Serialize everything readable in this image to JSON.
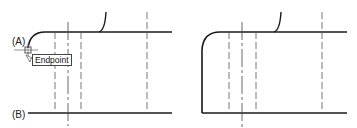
{
  "labels": {
    "a": "(A)",
    "b": "(B)"
  },
  "tooltip": {
    "text": "Endpoint"
  },
  "colors": {
    "stroke": "#1a1a1a",
    "dashed": "#555555",
    "snap_marker": "#666666"
  },
  "panels": [
    {
      "name": "before",
      "description": "Left panel: fillet curve (A) with endpoint snap, line (B) below"
    },
    {
      "name": "after",
      "description": "Right panel: curve extended down to line (B)"
    }
  ]
}
